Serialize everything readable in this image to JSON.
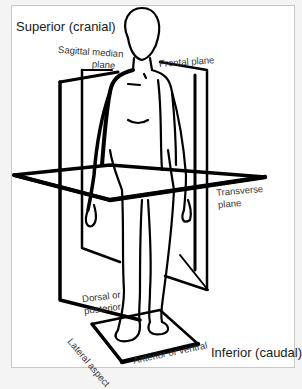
{
  "diagram": {
    "labels": {
      "superior": "Superior (cranial)",
      "inferior": "Inferior (caudal)",
      "sagittal_line1": "Sagittal median",
      "sagittal_line2": "plane",
      "frontal": "Frontal plane",
      "transverse_line1": "Transverse",
      "transverse_line2": "plane",
      "dorsal_line1": "Dorsal or",
      "dorsal_line2": "posterior",
      "lateral": "Lateral aspect",
      "anterior": "Anterior or ventral"
    },
    "colors": {
      "ink": "#000000",
      "paper": "#ffffff",
      "border": "#c8c8c8"
    }
  }
}
